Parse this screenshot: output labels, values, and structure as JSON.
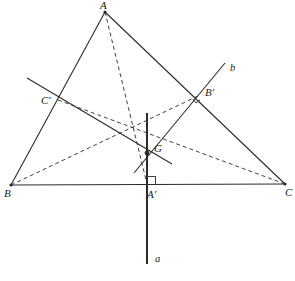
{
  "figure": {
    "kind": "euclidean-geometry-diagram",
    "width": 295,
    "height": 281,
    "background_color": "#ffffff",
    "stroke_color": "#2b2b2b",
    "label_color": "#1a1a1a"
  },
  "labels": {
    "A": "A",
    "B": "B",
    "C": "C",
    "A_prime": "A'",
    "B_prime": "B'",
    "C_prime": "C'",
    "G": "G",
    "line_a": "a",
    "line_b": "b"
  },
  "points": {
    "A": {
      "x": 105,
      "y": 12
    },
    "B": {
      "x": 11,
      "y": 185
    },
    "C": {
      "x": 285,
      "y": 184
    },
    "A_prime": {
      "x": 147,
      "y": 184
    },
    "B_prime": {
      "x": 200,
      "y": 95
    },
    "C_prime": {
      "x": 58,
      "y": 100
    },
    "G": {
      "x": 147,
      "y": 153
    }
  },
  "label_positions": {
    "A": {
      "x": 100,
      "y": 1
    },
    "B": {
      "x": 4,
      "y": 188
    },
    "C": {
      "x": 285,
      "y": 187
    },
    "A_prime": {
      "x": 148,
      "y": 189
    },
    "B_prime": {
      "x": 205,
      "y": 88
    },
    "C_prime": {
      "x": 42,
      "y": 96
    },
    "G": {
      "x": 154,
      "y": 144
    },
    "line_a": {
      "x": 155,
      "y": 256
    },
    "line_b": {
      "x": 230,
      "y": 64
    }
  },
  "segments": {
    "triangle_sides": [
      {
        "name": "side-AB",
        "x1": 105,
        "y1": 12,
        "x2": 11,
        "y2": 185,
        "style": "solid"
      },
      {
        "name": "side-AC",
        "x1": 105,
        "y1": 12,
        "x2": 285,
        "y2": 184,
        "style": "solid"
      },
      {
        "name": "side-BC",
        "x1": 11,
        "y1": 185,
        "x2": 285,
        "y2": 184,
        "style": "solid"
      }
    ],
    "medians": [
      {
        "name": "median-A-to-Aprime",
        "x1": 105,
        "y1": 12,
        "x2": 147,
        "y2": 184,
        "style": "dashed"
      },
      {
        "name": "median-B-to-Bprime",
        "x1": 11,
        "y1": 185,
        "x2": 200,
        "y2": 95,
        "style": "dashed"
      },
      {
        "name": "median-C-to-Cprime",
        "x1": 285,
        "y1": 184,
        "x2": 58,
        "y2": 100,
        "style": "dashed"
      }
    ],
    "construction_lines": [
      {
        "name": "line-a-vertical",
        "x1": 147,
        "y1": 113,
        "x2": 147,
        "y2": 264,
        "style": "solid"
      },
      {
        "name": "line-b-oblique",
        "x1": 225,
        "y1": 63,
        "x2": 134,
        "y2": 173,
        "style": "solid"
      },
      {
        "name": "line-through-Cprime-and-G",
        "x1": 27,
        "y1": 78,
        "x2": 172,
        "y2": 164,
        "style": "solid"
      }
    ]
  },
  "right_angle_marks": [
    {
      "name": "right-angle-at-Aprime",
      "x": 147,
      "y": 184,
      "size": 8,
      "dx": 1,
      "dy": -1
    },
    {
      "name": "right-angle-at-Bprime",
      "x": 200,
      "y": 95,
      "size": 7,
      "angle": 45
    }
  ],
  "centroid_marker": {
    "name": "centroid-dot",
    "x": 147,
    "y": 153,
    "radius": 2.4
  }
}
